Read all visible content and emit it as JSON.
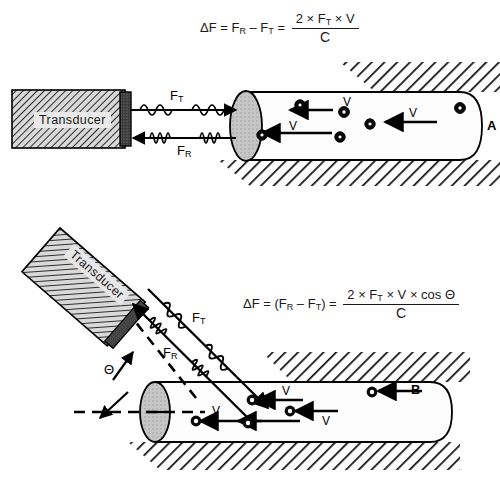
{
  "figure": {
    "panels": [
      {
        "id": "A",
        "label": "A",
        "description": "Transducer aligned parallel to vessel, beam angle zero"
      },
      {
        "id": "B",
        "label": "B",
        "description": "Transducer angled to vessel, beam at angle theta"
      }
    ]
  },
  "formula_a": {
    "lhs": "ΔF = F",
    "lhs_sub1": "R",
    "lhs_mid": " – F",
    "lhs_sub2": "T",
    "lhs_eq": " =",
    "numerator": "2 × F",
    "numerator_sub": "T",
    "numerator_tail": " × V",
    "denominator": "C"
  },
  "formula_b": {
    "lhs": "ΔF = (F",
    "lhs_sub1": "R",
    "lhs_mid": " – F",
    "lhs_sub2": "T",
    "lhs_close": ") =",
    "numerator": "2 × F",
    "numerator_sub": "T",
    "numerator_tail": " × V × cos Θ",
    "denominator": "C"
  },
  "panel_a": {
    "label": "A",
    "transducer_label": "Transducer",
    "beam_transmitted_label": "F",
    "beam_transmitted_sub": "T",
    "beam_received_label": "F",
    "beam_received_sub": "R",
    "velocity_labels": [
      "V",
      "V"
    ],
    "velocity_label_text": "V"
  },
  "panel_b": {
    "label": "B",
    "transducer_label": "Transducer",
    "beam_transmitted_label": "F",
    "beam_transmitted_sub": "T",
    "beam_received_label": "F",
    "beam_received_sub": "R",
    "angle_label": "Θ",
    "velocity_labels": [
      "V",
      "V",
      "V"
    ],
    "velocity_label_text": "V"
  },
  "colors": {
    "background": "#ffffff",
    "ink": "#000000",
    "transducer_fill": "#d8d8d8",
    "transducer_hatch": "#3a3a3a",
    "crystal_fill": "#3b3b3b",
    "vessel_fill": "#fdfdfd",
    "vessel_end_fill": "#c9c9c9",
    "tissue_hatch": "#111111",
    "cell_fill": "#0a0a0a"
  }
}
